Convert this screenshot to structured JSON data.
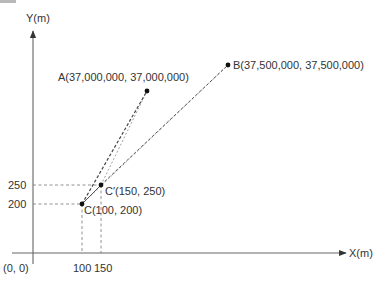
{
  "diagram": {
    "axes": {
      "x_label_var": "X",
      "x_label_unit": "(m)",
      "y_label_var": "Y",
      "y_label_unit": "(m)",
      "origin_label": "(0, 0)",
      "x_ticks": [
        "100",
        "150"
      ],
      "y_ticks": [
        "250",
        "200"
      ]
    },
    "points": {
      "A": {
        "name": "A",
        "coords": "(37,000,000, 37,000,000)"
      },
      "B": {
        "name": "B",
        "coords": "(37,500,000, 37,500,000)"
      },
      "C_prime": {
        "name": "C′",
        "coords": "(150, 250)"
      },
      "C": {
        "name": "C",
        "coords": "(100, 200)"
      }
    },
    "colors": {
      "axis": "#555555",
      "line": "#444444",
      "guide": "#666666",
      "point": "#111111",
      "text": "#333333"
    }
  }
}
